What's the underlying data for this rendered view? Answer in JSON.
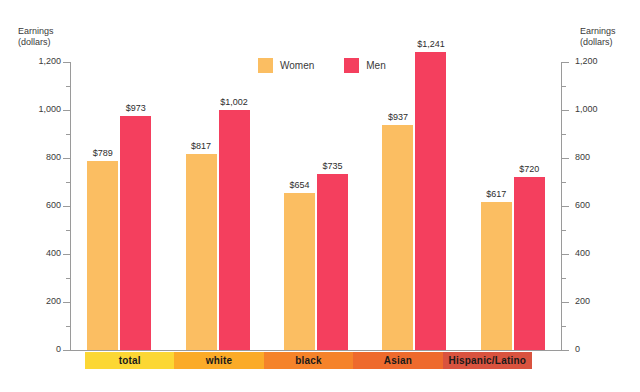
{
  "chart_data": {
    "type": "bar",
    "title": "",
    "xlabel": "",
    "ylabel": "Earnings\n(dollars)",
    "ylabel_right": "Earnings\n(dollars)",
    "ylim": [
      0,
      1200
    ],
    "yticks": [
      0,
      200,
      400,
      600,
      800,
      1000,
      1200
    ],
    "ytick_labels": [
      "0",
      "200",
      "400",
      "600",
      "800",
      "1,000",
      "1,200"
    ],
    "minor_ticks": [
      100,
      300,
      500,
      700,
      900,
      1100
    ],
    "grid": false,
    "legend_position": "top-center",
    "categories": [
      "total",
      "white",
      "black",
      "Asian",
      "Hispanic/Latino"
    ],
    "series": [
      {
        "name": "Women",
        "color": "#fbbe62",
        "values": [
          789,
          817,
          654,
          937,
          617
        ],
        "labels": [
          "$789",
          "$817",
          "$654",
          "$937",
          "$617"
        ]
      },
      {
        "name": "Men",
        "color": "#f43f5e",
        "values": [
          973,
          1002,
          735,
          1241,
          720
        ],
        "labels": [
          "$973",
          "$1,002",
          "$735",
          "$1,241",
          "$720"
        ]
      }
    ],
    "category_band_colors": [
      "#fcd734",
      "#fbab28",
      "#f5832a",
      "#ee6a2d",
      "#d9533f"
    ]
  }
}
